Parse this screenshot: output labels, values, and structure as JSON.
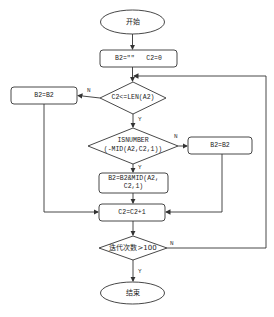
{
  "nodes": {
    "start": "开始",
    "init": "B2=\"\"   C2=0",
    "cond_len": "C2<=LEN(A2)",
    "left_box": "B2=B2",
    "cond_isnum_line1": "ISNUMBER",
    "cond_isnum_line2": "(-MID(A2,C2,1))",
    "right_box": "B2=B2",
    "concat_line1": "B2=B2&MID(A2,",
    "concat_line2": "C2,1)",
    "increment": "C2=C2+1",
    "cond_iter": "迭代次数>100",
    "end": "结束"
  },
  "edges": {
    "len_no": "N",
    "len_yes": "Y",
    "isnum_no": "N",
    "isnum_yes": "Y",
    "iter_no": "N",
    "iter_yes": "Y"
  },
  "colors": {
    "stroke": "#333333",
    "fill": "#ffffff"
  }
}
